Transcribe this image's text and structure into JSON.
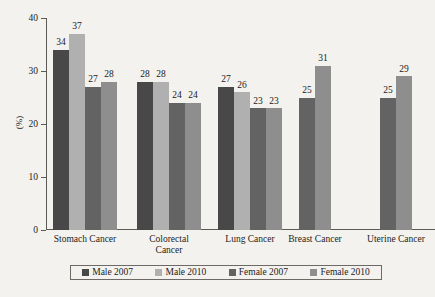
{
  "chart_data": {
    "type": "bar",
    "title": "",
    "subtitle": "",
    "xlabel": "",
    "ylabel": "(%)",
    "ylim": [
      0,
      40
    ],
    "yticks": [
      0,
      10,
      20,
      30,
      40
    ],
    "grid": false,
    "legend_position": "bottom",
    "categories": [
      "Stomach Cancer",
      "Colorectal Cancer",
      "Lung Cancer",
      "Breast Cancer",
      "Uterine Cancer"
    ],
    "category_lines": [
      [
        "Stomach Cancer"
      ],
      [
        "Colorectal",
        "Cancer"
      ],
      [
        "Lung Cancer"
      ],
      [
        "Breast Cancer"
      ],
      [
        "Uterine Cancer"
      ]
    ],
    "series": [
      {
        "name": "Male 2007",
        "color": "#484848",
        "values": [
          34,
          28,
          27,
          null,
          null
        ]
      },
      {
        "name": "Male 2010",
        "color": "#b0b0b0",
        "values": [
          37,
          28,
          26,
          null,
          null
        ]
      },
      {
        "name": "Female 2007",
        "color": "#636363",
        "values": [
          27,
          24,
          23,
          25,
          25
        ]
      },
      {
        "name": "Female 2010",
        "color": "#8e8e8e",
        "values": [
          28,
          24,
          23,
          31,
          29
        ]
      }
    ]
  },
  "legend": {
    "items": [
      {
        "label": "Male 2007",
        "color": "#484848"
      },
      {
        "label": "Male 2010",
        "color": "#b0b0b0"
      },
      {
        "label": "Female 2007",
        "color": "#636363"
      },
      {
        "label": "Female 2010",
        "color": "#8e8e8e"
      }
    ]
  },
  "axis": {
    "y_title": "(%)",
    "y_ticks": [
      "0",
      "10",
      "20",
      "30",
      "40"
    ]
  }
}
